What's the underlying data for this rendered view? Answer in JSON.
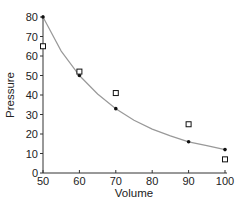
{
  "chart_data": {
    "type": "scatter",
    "title": "",
    "xlabel": "Volume",
    "ylabel": "Pressure",
    "xlim": [
      50,
      100
    ],
    "ylim": [
      0,
      80
    ],
    "x_ticks": [
      50,
      60,
      70,
      80,
      90,
      100
    ],
    "y_ticks": [
      0,
      10,
      20,
      30,
      40,
      50,
      60,
      70,
      80
    ],
    "grid": false,
    "legend": null,
    "series": [
      {
        "name": "fitted points",
        "marker": "dot",
        "x": [
          50,
          60,
          70,
          90,
          100
        ],
        "y": [
          80,
          50,
          33,
          16,
          12
        ]
      },
      {
        "name": "measured points",
        "marker": "open-square",
        "x": [
          50,
          60,
          70,
          90,
          100
        ],
        "y": [
          65,
          52,
          41,
          25,
          7
        ]
      }
    ],
    "curve": {
      "name": "fitted curve",
      "description": "smooth decreasing curve through dot points",
      "x": [
        50,
        55,
        60,
        65,
        70,
        75,
        80,
        85,
        90,
        95,
        100
      ],
      "y": [
        80,
        62.5,
        50,
        40.5,
        33,
        27,
        22.5,
        19,
        16,
        14,
        12
      ]
    },
    "colors": {
      "axis": "#333333",
      "curve": "#999999",
      "markers": "#111111"
    }
  }
}
